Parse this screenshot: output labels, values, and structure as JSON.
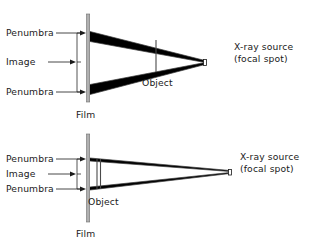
{
  "figure": {
    "background_color": "#ffffff",
    "ink_color": "#000000",
    "film_color": "#b3b3b3",
    "penumbra_color": "#000000",
    "ray_color": "#333333"
  },
  "panels": [
    {
      "id": "top",
      "description": "Object far from film: large penumbra",
      "labels": {
        "penumbra_upper": "Penumbra",
        "image": "Image",
        "penumbra_lower": "Penumbra",
        "film": "Film",
        "object": "Object",
        "source_line1": "X-ray source",
        "source_line2": "(focal spot)"
      }
    },
    {
      "id": "bottom",
      "description": "Object close to film: small penumbra",
      "labels": {
        "penumbra_upper": "Penumbra",
        "image": "Image",
        "penumbra_lower": "Penumbra",
        "film": "Film",
        "object": "Object",
        "source_line1": "X-ray source",
        "source_line2": "(focal spot)"
      }
    }
  ]
}
